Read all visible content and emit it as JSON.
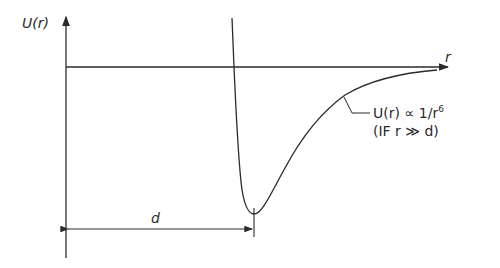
{
  "diagram": {
    "y_axis_label": "U(r)",
    "x_axis_label": "r",
    "distance_label": "d",
    "annotation": {
      "line1": "U(r) ∝ 1/r",
      "line1_superscript": "6",
      "line2": "(IF r ≫ d)"
    },
    "colors": {
      "stroke": "#2a2a2a",
      "background": "#ffffff"
    }
  }
}
